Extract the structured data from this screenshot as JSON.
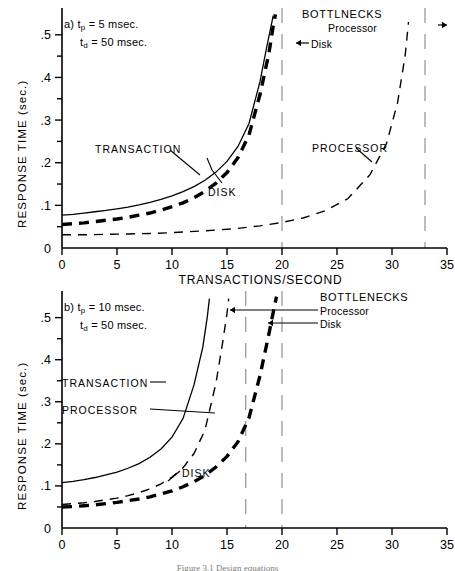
{
  "figure": {
    "caption": "Figure 3.1  Design equations",
    "background": "#ffffff",
    "ink": "#000000",
    "asymptote_color": "#9a9a9a"
  },
  "axes": {
    "x_title": "TRANSACTIONS/SECOND",
    "y_title": "RESPONSE TIME (sec.)",
    "x_ticks": [
      "0",
      "5",
      "10",
      "15",
      "20",
      "25",
      "30",
      "35"
    ],
    "x_tick_values": [
      0,
      5,
      10,
      15,
      20,
      25,
      30,
      35
    ],
    "x_minor_step": 1,
    "y_ticks": [
      ".1",
      ".2",
      ".3",
      ".4",
      ".5"
    ],
    "y_tick_values": [
      0.1,
      0.2,
      0.3,
      0.4,
      0.5
    ],
    "y_origin_label": "0",
    "y_minor_step": 0.05,
    "xlim": [
      0,
      35
    ],
    "ylim": [
      0,
      0.53
    ]
  },
  "panel_a": {
    "id": "a",
    "param_line1_prefix": "a)",
    "param_line1": "t",
    "param_line1_sub": "p",
    "param_line1_value": "= 5 msec.",
    "param_line2": "t",
    "param_line2_sub": "d",
    "param_line2_value": "= 50 msec.",
    "t_p_msec": 5,
    "t_d_msec": 50,
    "bottlenecks_title": "BOTTLNECKS",
    "bottleneck_processor": "Processor",
    "bottleneck_disk": "Disk",
    "label_transaction": "TRANSACTION",
    "label_disk": "DISK",
    "label_processor": "PROCESSOR",
    "disk_asymptote": 20,
    "processor_asymptote": 33
  },
  "panel_b": {
    "id": "b",
    "param_line1_prefix": "b)",
    "param_line1": "t",
    "param_line1_sub": "p",
    "param_line1_value": "= 10 msec.",
    "param_line2": "t",
    "param_line2_sub": "d",
    "param_line2_value": "= 50 msec.",
    "t_p_msec": 10,
    "t_d_msec": 50,
    "bottlenecks_title": "BOTTLENECKS",
    "bottleneck_processor": "Processor",
    "bottleneck_disk": "Disk",
    "label_transaction": "TRANSACTION",
    "label_processor": "PROCESSOR",
    "label_disk": "DISK",
    "processor_asymptote": 16.7,
    "disk_asymptote": 20
  },
  "chart_data": [
    {
      "type": "line",
      "title": "a) t_p = 5 msec., t_d = 50 msec.",
      "xlabel": "TRANSACTIONS/SECOND",
      "ylabel": "RESPONSE TIME (sec.)",
      "xlim": [
        0,
        35
      ],
      "ylim": [
        0,
        0.53
      ],
      "grid": false,
      "legend": "inline-annotations",
      "annotations": [
        {
          "text": "BOTTLNECKS",
          "x": 26,
          "y": 0.525
        },
        {
          "text": "Processor",
          "x": 28,
          "y": 0.495,
          "arrow": "right",
          "points_to_x": 33
        },
        {
          "text": "Disk",
          "x": 21.5,
          "y": 0.458,
          "arrow": "left",
          "points_to_x": 20
        },
        {
          "text": "TRANSACTION",
          "x": 6.5,
          "y": 0.245,
          "points_to": "transaction"
        },
        {
          "text": "DISK",
          "x": 15.5,
          "y": 0.168,
          "points_to": "disk"
        },
        {
          "text": "PROCESSOR",
          "x": 23.5,
          "y": 0.243,
          "points_to": "processor"
        }
      ],
      "vertical_asymptotes": [
        {
          "name": "Disk bottleneck",
          "x": 20
        },
        {
          "name": "Processor bottleneck",
          "x": 33
        }
      ],
      "series": [
        {
          "name": "TRANSACTION",
          "style": "solid",
          "asymptote_x": 19.4,
          "y_intercept": 0.077,
          "x": [
            0,
            1,
            2,
            3,
            4,
            5,
            6,
            7,
            8,
            9,
            10,
            11,
            12,
            13,
            14,
            15,
            16,
            17,
            18,
            18.6,
            19,
            19.2
          ],
          "values": [
            0.077,
            0.079,
            0.082,
            0.085,
            0.088,
            0.092,
            0.096,
            0.101,
            0.107,
            0.114,
            0.122,
            0.132,
            0.144,
            0.159,
            0.178,
            0.203,
            0.238,
            0.292,
            0.39,
            0.47,
            0.52,
            0.545
          ]
        },
        {
          "name": "DISK",
          "style": "thick-dashed",
          "asymptote_x": 19.6,
          "y_intercept": 0.055,
          "x": [
            0,
            1,
            2,
            3,
            4,
            5,
            6,
            7,
            8,
            9,
            10,
            11,
            12,
            13,
            14,
            15,
            16,
            17,
            18,
            18.8,
            19.2,
            19.4
          ],
          "values": [
            0.055,
            0.057,
            0.059,
            0.062,
            0.065,
            0.068,
            0.072,
            0.077,
            0.082,
            0.089,
            0.097,
            0.106,
            0.118,
            0.133,
            0.152,
            0.177,
            0.212,
            0.265,
            0.36,
            0.455,
            0.52,
            0.548
          ]
        },
        {
          "name": "PROCESSOR",
          "style": "thin-dashed",
          "asymptote_x": 31.8,
          "y_intercept": 0.031,
          "x": [
            0,
            2,
            4,
            6,
            8,
            10,
            12,
            14,
            16,
            18,
            20,
            22,
            24,
            26,
            28,
            29.5,
            30.5,
            31.2,
            31.5
          ],
          "values": [
            0.031,
            0.031,
            0.032,
            0.033,
            0.034,
            0.036,
            0.039,
            0.042,
            0.046,
            0.052,
            0.06,
            0.071,
            0.088,
            0.116,
            0.172,
            0.245,
            0.34,
            0.452,
            0.53
          ]
        }
      ]
    },
    {
      "type": "line",
      "title": "b) t_p = 10 msec., t_d = 50 msec.",
      "xlabel": "TRANSACTIONS/SECOND",
      "ylabel": "RESPONSE TIME (sec.)",
      "xlim": [
        0,
        35
      ],
      "ylim": [
        0,
        0.53
      ],
      "grid": false,
      "legend": "inline-annotations",
      "annotations": [
        {
          "text": "BOTTLENECKS",
          "x": 24.5,
          "y": 0.525
        },
        {
          "text": "Processor",
          "x": 24.5,
          "y": 0.497,
          "arrow": "left",
          "points_to_x": 16.7
        },
        {
          "text": "Disk",
          "x": 24.5,
          "y": 0.47,
          "arrow": "left",
          "points_to_x": 20
        },
        {
          "text": "TRANSACTION",
          "x": 3.0,
          "y": 0.322,
          "points_to": "transaction"
        },
        {
          "text": "PROCESSOR",
          "x": 3.0,
          "y": 0.272,
          "points_to": "processor"
        },
        {
          "text": "DISK",
          "x": 13.0,
          "y": 0.108,
          "points_to": "disk"
        }
      ],
      "vertical_asymptotes": [
        {
          "name": "Processor bottleneck",
          "x": 16.7
        },
        {
          "name": "Disk bottleneck",
          "x": 20
        }
      ],
      "series": [
        {
          "name": "TRANSACTION",
          "style": "solid",
          "asymptote_x": 13.6,
          "y_intercept": 0.108,
          "x": [
            0,
            1,
            2,
            3,
            4,
            5,
            6,
            7,
            8,
            9,
            10,
            11,
            12,
            12.8,
            13.2,
            13.4
          ],
          "values": [
            0.108,
            0.111,
            0.115,
            0.12,
            0.126,
            0.133,
            0.142,
            0.153,
            0.168,
            0.188,
            0.216,
            0.26,
            0.34,
            0.43,
            0.5,
            0.545
          ]
        },
        {
          "name": "PROCESSOR",
          "style": "thin-dashed",
          "asymptote_x": 15.3,
          "y_intercept": 0.056,
          "x": [
            0,
            1,
            2,
            3,
            4,
            5,
            6,
            7,
            8,
            9,
            10,
            11,
            12,
            13,
            14,
            14.6,
            15.0,
            15.15
          ],
          "values": [
            0.056,
            0.058,
            0.06,
            0.063,
            0.067,
            0.071,
            0.077,
            0.084,
            0.093,
            0.105,
            0.121,
            0.143,
            0.177,
            0.233,
            0.345,
            0.44,
            0.51,
            0.545
          ]
        },
        {
          "name": "DISK",
          "style": "thick-dashed",
          "asymptote_x": 19.7,
          "y_intercept": 0.05,
          "x": [
            0,
            1,
            2,
            3,
            4,
            5,
            6,
            7,
            8,
            9,
            10,
            11,
            12,
            13,
            14,
            15,
            16,
            17,
            18,
            18.8,
            19.3,
            19.5
          ],
          "values": [
            0.05,
            0.051,
            0.053,
            0.055,
            0.058,
            0.061,
            0.065,
            0.069,
            0.074,
            0.081,
            0.088,
            0.098,
            0.11,
            0.125,
            0.145,
            0.17,
            0.205,
            0.262,
            0.362,
            0.46,
            0.525,
            0.55
          ]
        }
      ]
    }
  ]
}
